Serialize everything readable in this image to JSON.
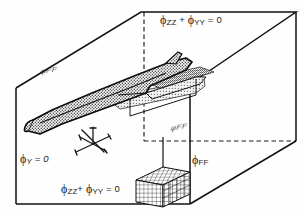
{
  "figure": {
    "type": "technical-diagram",
    "background_color": "#fefefe",
    "line_color": "#111111",
    "stipple_color": "#555555"
  },
  "labels": {
    "top_face": {
      "text": "φzz + φyy = 0",
      "phi": "ϕ",
      "sub1": "ZZ",
      "plus": " + ",
      "phi2": "ϕ",
      "sub2": "YY",
      "eq": " = 0",
      "x": 160,
      "y": 13
    },
    "bottom_face": {
      "text": "φzz + φyy = 0",
      "phi": "ϕ",
      "sub1": "ZZ",
      "plus": "+ ",
      "phi2": "ϕ",
      "sub2": "YY",
      "eq": " = 0",
      "x": 61,
      "y": 183
    },
    "symmetry_plane": {
      "phi": "ϕ",
      "sub": "Y",
      "eq": " = 0",
      "text": "φy = 0",
      "x": 20,
      "y": 153
    },
    "far_field_right": {
      "phi": "ϕ",
      "sub": "FF",
      "text": "φFF",
      "x": 192,
      "y": 155
    },
    "far_field_top_left": {
      "text": "φFF",
      "x": 43,
      "y": 68
    },
    "far_field_mid_right": {
      "text": "φFF",
      "x": 173,
      "y": 126
    }
  },
  "elements": {
    "outer_box": "far-field-boundary-box",
    "aircraft": "delta-wing-body-surface",
    "grid_cell": "structured-grid-mesh-cell",
    "axes_marker": "coordinate-axes-star",
    "wake_sheet": "stippled-wake-plane"
  }
}
